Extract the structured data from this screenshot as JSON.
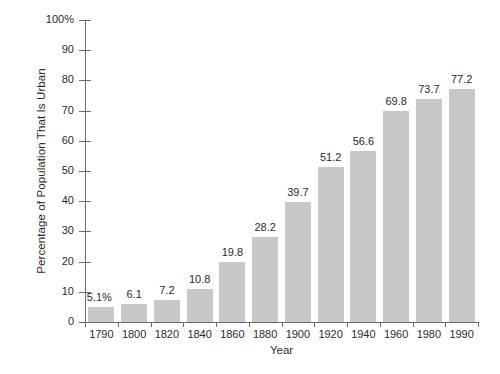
{
  "chart_data": {
    "type": "bar",
    "title": "",
    "xlabel": "Year",
    "ylabel": "Percentage of Population That Is Urban",
    "categories": [
      "1790",
      "1800",
      "1820",
      "1840",
      "1860",
      "1880",
      "1900",
      "1920",
      "1940",
      "1960",
      "1980",
      "1990"
    ],
    "values": [
      5.1,
      6.1,
      7.2,
      10.8,
      19.8,
      28.2,
      39.7,
      51.2,
      56.6,
      69.8,
      73.7,
      77.2
    ],
    "value_labels": [
      "5.1%",
      "6.1",
      "7.2",
      "10.8",
      "19.8",
      "28.2",
      "39.7",
      "51.2",
      "56.6",
      "69.8",
      "73.7",
      "77.2"
    ],
    "ylim": [
      0,
      100
    ],
    "ytick_values": [
      0,
      10,
      20,
      30,
      40,
      50,
      60,
      70,
      80,
      90,
      100
    ],
    "ytick_labels": [
      "0",
      "10",
      "20",
      "30",
      "40",
      "50",
      "60",
      "70",
      "80",
      "90",
      "100%"
    ],
    "grid": false,
    "legend": false,
    "bar_color": "#c8c8c8",
    "axis_color": "#6e6e6e",
    "text_color": "#2b2b2b",
    "background_color": "#ffffff"
  }
}
